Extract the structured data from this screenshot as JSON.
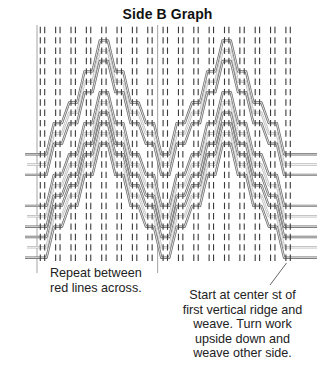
{
  "title": "Side B Graph",
  "annotations": {
    "left": [
      "Repeat between",
      "red lines across."
    ],
    "right": [
      "Start at center st of",
      "first vertical ridge and",
      "weave. Turn work",
      "upside down and",
      "weave other side."
    ]
  },
  "graph": {
    "rows": 23,
    "column_pairs": 17,
    "repeat_columns": 8,
    "peak_columns": [
      4,
      12
    ],
    "valley_columns": [
      0,
      8,
      16
    ],
    "colors": {
      "tick": "#3a3a3a",
      "black_line": "#6a6a6a",
      "red_line": "#bcbcbc",
      "guide_line": "#9a9a9a",
      "leader_line": "#555555"
    },
    "strands": [
      {
        "valley_row": 12,
        "peak_row": 1,
        "line": "black"
      },
      {
        "valley_row": 13,
        "peak_row": 2,
        "line": "red"
      },
      {
        "valley_row": 14,
        "peak_row": 3,
        "line": "black"
      },
      {
        "valley_row": 17,
        "peak_row": 6,
        "line": "black"
      },
      {
        "valley_row": 18,
        "peak_row": 7,
        "line": "red"
      },
      {
        "valley_row": 19,
        "peak_row": 8,
        "line": "black"
      },
      {
        "valley_row": 20,
        "peak_row": 9,
        "line": "black"
      },
      {
        "valley_row": 21,
        "peak_row": 10,
        "line": "red"
      },
      {
        "valley_row": 22,
        "peak_row": 11,
        "line": "black"
      }
    ]
  }
}
